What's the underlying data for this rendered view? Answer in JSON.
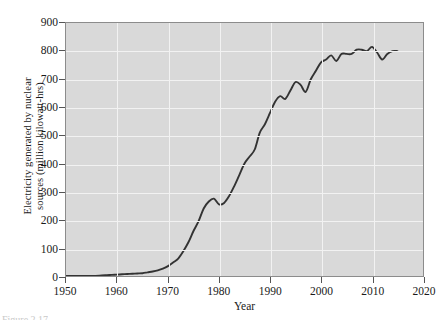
{
  "caption": "Figure 2.17",
  "chart_data": {
    "type": "line",
    "title": "",
    "xlabel": "Year",
    "ylabel_line1": "Electricity generated by nuclear",
    "ylabel_line2": "sources (million kilowatt-hrs)",
    "ylabel": "Electricity generated by nuclear sources (million kilowatt-hrs)",
    "xlim": [
      1950,
      2020
    ],
    "ylim": [
      0,
      900
    ],
    "xticks": [
      1950,
      1960,
      1970,
      1980,
      1990,
      2000,
      2010,
      2020
    ],
    "yticks": [
      0,
      100,
      200,
      300,
      400,
      500,
      600,
      700,
      800,
      900
    ],
    "xtick_labels": [
      "1950",
      "1960",
      "1970",
      "1980",
      "1990",
      "2000",
      "2010",
      "2020"
    ],
    "ytick_labels": [
      "0",
      "100",
      "200",
      "300",
      "400",
      "500",
      "600",
      "700",
      "800",
      "900"
    ],
    "grid": true,
    "legend": "none",
    "plot_background": "#d9d9d9",
    "gridline_color": "#f2f2f2",
    "line_color": "#333333",
    "series": [
      {
        "name": "Electricity generated by nuclear sources",
        "x": [
          1950,
          1955,
          1957,
          1958,
          1959,
          1960,
          1961,
          1962,
          1963,
          1964,
          1965,
          1966,
          1967,
          1968,
          1969,
          1970,
          1971,
          1972,
          1973,
          1974,
          1975,
          1976,
          1977,
          1978,
          1979,
          1980,
          1981,
          1982,
          1983,
          1984,
          1985,
          1986,
          1987,
          1988,
          1989,
          1990,
          1991,
          1992,
          1993,
          1994,
          1995,
          1996,
          1997,
          1998,
          1999,
          2000,
          2001,
          2002,
          2003,
          2004,
          2005,
          2006,
          2007,
          2008,
          2009,
          2010,
          2011,
          2012,
          2013,
          2014,
          2015
        ],
        "y": [
          0,
          0,
          2,
          3,
          4,
          5,
          6,
          7,
          8,
          9,
          10,
          13,
          16,
          20,
          26,
          35,
          48,
          62,
          88,
          120,
          160,
          195,
          240,
          265,
          275,
          255,
          260,
          285,
          320,
          360,
          400,
          425,
          450,
          510,
          540,
          580,
          620,
          640,
          630,
          660,
          690,
          680,
          655,
          700,
          730,
          760,
          770,
          785,
          765,
          790,
          790,
          790,
          805,
          805,
          800,
          815,
          795,
          770,
          790,
          800,
          800
        ]
      }
    ]
  }
}
